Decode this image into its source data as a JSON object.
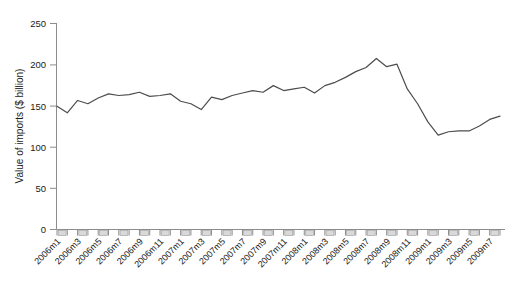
{
  "chart_data": {
    "type": "line",
    "title": "",
    "subtitle": "",
    "xlabel": "",
    "ylabel": "Value of imports ($ billion)",
    "ylim": [
      0,
      250
    ],
    "yticks": [
      0,
      50,
      100,
      150,
      200,
      250
    ],
    "ytick_labels": [
      "0",
      "50",
      "100",
      "150",
      "200",
      "250"
    ],
    "grid": false,
    "legend": null,
    "legend_position": "none",
    "line_color": "#4d4d4d",
    "axis_color": "#8c8c8c",
    "x": [
      "2006m1",
      "2006m2",
      "2006m3",
      "2006m4",
      "2006m5",
      "2006m6",
      "2006m7",
      "2006m8",
      "2006m9",
      "2006m10",
      "2006m11",
      "2006m12",
      "2007m1",
      "2007m2",
      "2007m3",
      "2007m4",
      "2007m5",
      "2007m6",
      "2007m7",
      "2007m8",
      "2007m9",
      "2007m10",
      "2007m11",
      "2007m12",
      "2008m1",
      "2008m2",
      "2008m3",
      "2008m4",
      "2008m5",
      "2008m6",
      "2008m7",
      "2008m8",
      "2008m9",
      "2008m10",
      "2008m11",
      "2008m12",
      "2009m1",
      "2009m2",
      "2009m3",
      "2009m4",
      "2009m5",
      "2009m6",
      "2009m7",
      "2009m8"
    ],
    "xtick_labels": [
      "2006m1",
      "2006m3",
      "2006m5",
      "2006m7",
      "2006m9",
      "2006m11",
      "2007m1",
      "2007m3",
      "2007m5",
      "2007m7",
      "2007m9",
      "2007m11",
      "2008m1",
      "2008m3",
      "2008m5",
      "2008m7",
      "2008m9",
      "2008m11",
      "2009m1",
      "2009m3",
      "2009m5",
      "2009m7"
    ],
    "values": [
      149,
      141,
      156,
      152,
      159,
      164,
      162,
      163,
      166,
      161,
      162,
      164,
      155,
      152,
      145,
      160,
      157,
      162,
      165,
      168,
      166,
      174,
      168,
      170,
      172,
      165,
      174,
      178,
      184,
      191,
      196,
      207,
      197,
      200,
      170,
      152,
      130,
      114,
      118,
      119,
      119,
      125,
      133,
      137
    ],
    "series_name": "Value of imports"
  }
}
